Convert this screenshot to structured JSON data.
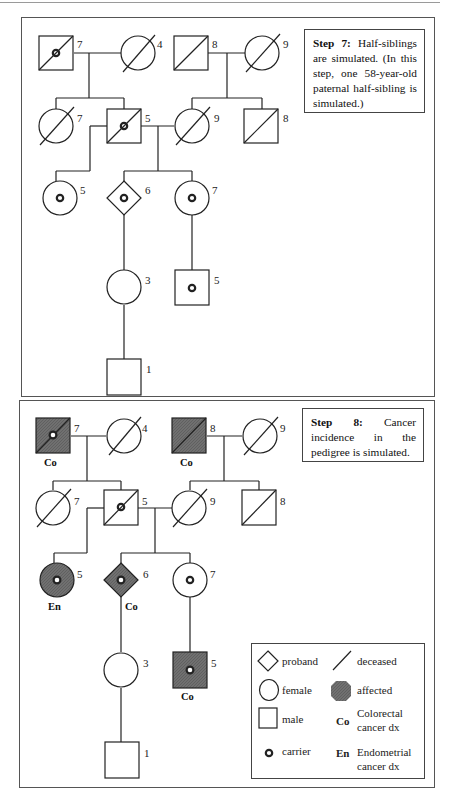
{
  "figure": {
    "colors": {
      "affected_fill": "#6e6e6e",
      "line": "#222222",
      "border": "#555555",
      "background": "#ffffff"
    },
    "step7": {
      "title": "Step 7:",
      "text": "Half-siblings are simulated. (In this step, one 58-year-old paternal half-sibling is simulated.)",
      "ages": {
        "pgf": "7",
        "pgm": "4",
        "mgf": "8",
        "mgm": "9",
        "paunt": "7",
        "father": "5",
        "mother": "9",
        "muncle": "8",
        "halfsib": "5",
        "proband": "6",
        "sister": "7",
        "daughter": "3",
        "nephew": "5",
        "grandson": "1"
      }
    },
    "step8": {
      "title": "Step 8:",
      "text": "Cancer incidence in the pedigree is simulated.",
      "ages": {
        "pgf": "7",
        "pgm": "4",
        "mgf": "8",
        "mgm": "9",
        "paunt": "7",
        "father": "5",
        "mother": "9",
        "muncle": "8",
        "halfsib": "5",
        "proband": "6",
        "sister": "7",
        "daughter": "3",
        "nephew": "5",
        "grandson": "1"
      },
      "dx": {
        "pgf": "Co",
        "mgf": "Co",
        "halfsib": "En",
        "proband": "Co",
        "nephew": "Co"
      }
    },
    "legend": {
      "proband": "proband",
      "female": "female",
      "male": "male",
      "carrier": "carrier",
      "deceased": "deceased",
      "affected": "affected",
      "co_abbr": "Co",
      "co_label_1": "Colorectal",
      "co_label_2": "cancer dx",
      "en_abbr": "En",
      "en_label_1": "Endometrial",
      "en_label_2": "cancer dx"
    }
  }
}
